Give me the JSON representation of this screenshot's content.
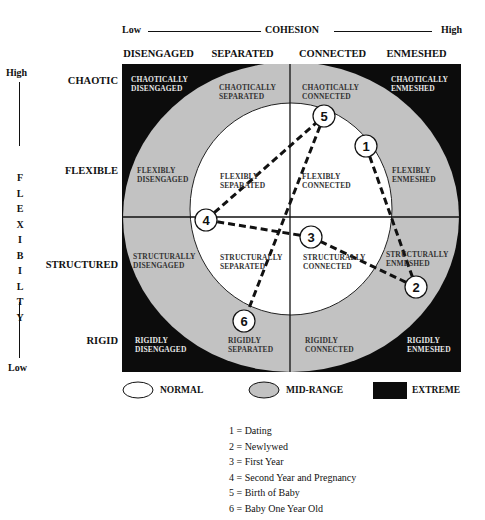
{
  "cohesion_axis": {
    "low": "Low",
    "title": "COHESION",
    "high": "High",
    "levels": [
      "DISENGAGED",
      "SEPARATED",
      "CONNECTED",
      "ENMESHED"
    ]
  },
  "flexibility_axis": {
    "high": "High",
    "title_letters": [
      "F",
      "L",
      "E",
      "X",
      "I",
      "B",
      "I",
      "L",
      "T",
      "Y"
    ],
    "low": "Low",
    "levels": [
      "CHAOTIC",
      "FLEXIBLE",
      "STRUCTURED",
      "RIGID"
    ]
  },
  "cells": {
    "chaotically_disengaged": [
      "CHAOTICALLY",
      "DISENGAGED"
    ],
    "chaotically_separated": [
      "CHAOTICALLY",
      "SEPARATED"
    ],
    "chaotically_connected": [
      "CHAOTICALLY",
      "CONNECTED"
    ],
    "chaotically_enmeshed": [
      "CHAOTICALLY",
      "ENMESHED"
    ],
    "flexibly_disengaged": [
      "FLEXIBLY",
      "DISENGAGED"
    ],
    "flexibly_separated": [
      "FLEXIBLY",
      "SEPARATED"
    ],
    "flexibly_connected": [
      "FLEXIBLY",
      "CONNECTED"
    ],
    "flexibly_enmeshed": [
      "FLEXIBLY",
      "ENMESHED"
    ],
    "structurally_disengaged": [
      "STRUCTURALLY",
      "DISENGAGED"
    ],
    "structurally_separated": [
      "STRUCTURALLY",
      "SEPARATED"
    ],
    "structurally_connected": [
      "STRUCTURALLY",
      "CONNECTED"
    ],
    "structurally_enmeshed": [
      "STRUCTURALLY",
      "ENMESHED"
    ],
    "rigidly_disengaged": [
      "RIGIDLY",
      "DISENGAGED"
    ],
    "rigidly_separated": [
      "RIGIDLY",
      "SEPARATED"
    ],
    "rigidly_connected": [
      "RIGIDLY",
      "CONNECTED"
    ],
    "rigidly_enmeshed": [
      "RIGIDLY",
      "ENMESHED"
    ]
  },
  "nodes": [
    {
      "id": "1",
      "x": 366,
      "y": 146
    },
    {
      "id": "2",
      "x": 416,
      "y": 287
    },
    {
      "id": "3",
      "x": 311,
      "y": 237
    },
    {
      "id": "4",
      "x": 206,
      "y": 220
    },
    {
      "id": "5",
      "x": 324,
      "y": 116
    },
    {
      "id": "6",
      "x": 244,
      "y": 321
    }
  ],
  "path_order": [
    "1",
    "2",
    "3",
    "4",
    "5",
    "6"
  ],
  "legend": {
    "normal": "NORMAL",
    "mid_range": "MID-RANGE",
    "extreme": "EXTREME"
  },
  "colors": {
    "normal": "#ffffff",
    "mid_range": "#c2c2c2",
    "extreme": "#0c0c0c"
  },
  "key": [
    "1 = Dating",
    "2 = Newlywed",
    "3 = First Year",
    "4 = Second Year and Pregnancy",
    "5 = Birth of Baby",
    "6 = Baby One Year Old"
  ]
}
